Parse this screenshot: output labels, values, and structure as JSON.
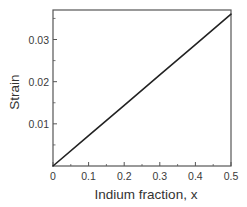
{
  "chart_data": {
    "type": "line",
    "title": "",
    "xlabel": "Indium fraction, x",
    "ylabel": "Strain",
    "xlim": [
      0,
      0.5
    ],
    "ylim": [
      0,
      0.037
    ],
    "x_ticks": [
      0,
      0.1,
      0.2,
      0.3,
      0.4,
      0.5
    ],
    "x_tick_labels": [
      "0",
      "0.1",
      "0.2",
      "0.3",
      "0.4",
      "0.5"
    ],
    "y_ticks": [
      0.01,
      0.02,
      0.03
    ],
    "y_tick_labels": [
      "0.01",
      "0.02",
      "0.03"
    ],
    "y_minor_ticks": [
      0.005,
      0.015,
      0.025,
      0.035
    ],
    "x_minor_ticks": [
      0.05,
      0.15,
      0.25,
      0.35,
      0.45
    ],
    "grid": false,
    "legend": null,
    "series": [
      {
        "name": "Strain",
        "x": [
          0,
          0.1,
          0.2,
          0.3,
          0.4,
          0.5
        ],
        "values": [
          0,
          0.0072,
          0.0144,
          0.0216,
          0.0288,
          0.036
        ],
        "color": "#222222"
      }
    ]
  },
  "layout": {
    "plot_left": 53,
    "plot_top": 10,
    "plot_right": 231,
    "plot_bottom": 166
  },
  "colors": {
    "frame": "#555555",
    "line": "#222222",
    "text": "#333333"
  }
}
